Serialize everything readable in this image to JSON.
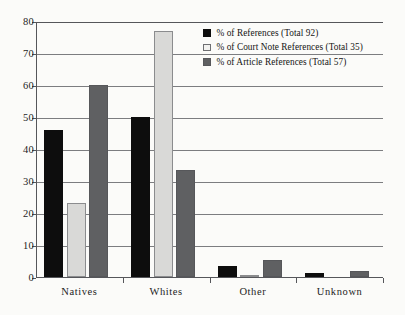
{
  "chart_data": {
    "type": "bar",
    "title": "",
    "subtitle": "",
    "xlabel": "",
    "ylabel": "",
    "categories": [
      "Natives",
      "Whites",
      "Other",
      "Unknown"
    ],
    "series": [
      {
        "name": "% of References (Total 92)",
        "color": "#0d0d0d",
        "values": [
          46,
          50,
          3.3,
          1.1
        ]
      },
      {
        "name": "% of  Court Note References (Total 35)",
        "color": "#d9d9d7",
        "values": [
          23,
          77,
          0.6,
          0
        ]
      },
      {
        "name": "% of  Article References (Total 57)",
        "color": "#5f6062",
        "values": [
          60,
          33.5,
          5.3,
          1.8
        ]
      }
    ],
    "ylim": [
      0,
      80
    ],
    "yticks": [
      0,
      10,
      20,
      30,
      40,
      50,
      60,
      70,
      80
    ],
    "ytick_labels": [
      "0",
      "10",
      "20",
      "30",
      "40",
      "50",
      "60",
      "70",
      "80"
    ],
    "grid": "horizontal",
    "legend_position": "top-right"
  },
  "legend": {
    "items": [
      {
        "label": "% of References (Total 92)"
      },
      {
        "label": "% of  Court Note References (Total 35)"
      },
      {
        "label": "% of  Article References (Total 57)"
      }
    ]
  },
  "colors": {
    "series_0": "#0d0d0d",
    "series_1": "#d9d9d7",
    "series_2": "#5f6062",
    "axis": "#55565a",
    "gridline": "#7c7d80",
    "background": "#fbfbf9"
  }
}
